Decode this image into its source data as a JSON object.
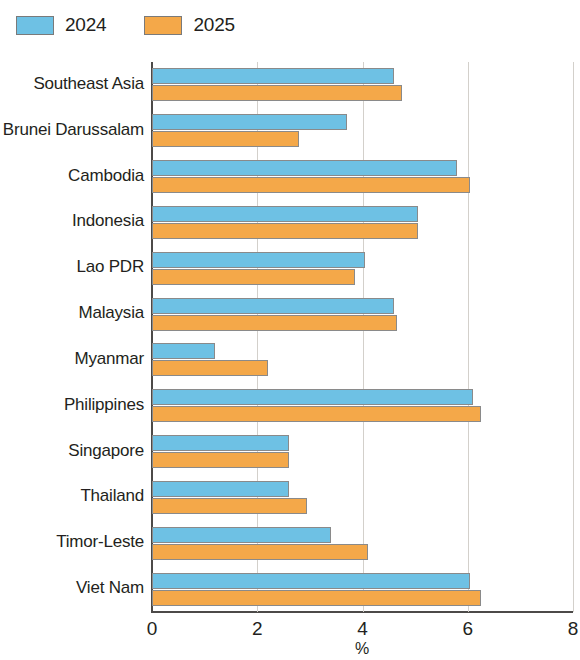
{
  "legend": {
    "position": "top-left",
    "items": [
      {
        "label": "2024",
        "color": "#6ec1e4",
        "swatch_name": "legend-swatch-2024"
      },
      {
        "label": "2025",
        "color": "#f4a849",
        "swatch_name": "legend-swatch-2025"
      }
    ]
  },
  "axis": {
    "x_ticks": [
      "0",
      "2",
      "4",
      "6",
      "8"
    ],
    "x_label": "%"
  },
  "chart_data": {
    "type": "bar",
    "orientation": "horizontal",
    "title": "",
    "subtitle": "",
    "xlabel": "%",
    "ylabel": "",
    "xlim": [
      0,
      8
    ],
    "xticks": [
      0,
      2,
      4,
      6,
      8
    ],
    "grid": true,
    "legend_position": "top-left",
    "categories": [
      "Southeast Asia",
      "Brunei Darussalam",
      "Cambodia",
      "Indonesia",
      "Lao PDR",
      "Malaysia",
      "Myanmar",
      "Philippines",
      "Singapore",
      "Thailand",
      "Timor-Leste",
      "Viet Nam"
    ],
    "series": [
      {
        "name": "2024",
        "color": "#6ec1e4",
        "values": [
          4.6,
          3.7,
          5.8,
          5.05,
          4.05,
          4.6,
          1.2,
          6.1,
          2.6,
          2.6,
          3.4,
          6.05
        ]
      },
      {
        "name": "2025",
        "color": "#f4a849",
        "values": [
          4.75,
          2.8,
          6.05,
          5.05,
          3.85,
          4.65,
          2.2,
          6.25,
          2.6,
          2.95,
          4.1,
          6.25
        ]
      }
    ]
  }
}
